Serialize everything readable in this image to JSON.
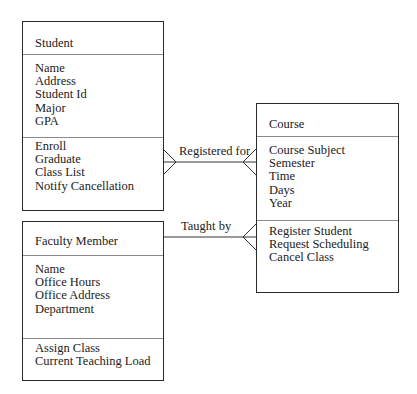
{
  "diagram": {
    "type": "uml-class-diagram",
    "classes": [
      {
        "id": "student",
        "name": "Student",
        "attributes": [
          "Name",
          "Address",
          "Student Id",
          "Major",
          "GPA"
        ],
        "operations": [
          "Enroll",
          "Graduate",
          "Class List",
          "Notify Cancellation"
        ]
      },
      {
        "id": "faculty",
        "name": "Faculty Member",
        "attributes": [
          "Name",
          "Office Hours",
          "Office Address",
          "Department"
        ],
        "operations": [
          "Assign Class",
          "Current Teaching Load"
        ]
      },
      {
        "id": "course",
        "name": "Course",
        "attributes": [
          "Course Subject",
          "Semester",
          "Time",
          "Days",
          "Year"
        ],
        "operations": [
          "Register Student",
          "Request Scheduling",
          "Cancel Class"
        ]
      }
    ],
    "associations": [
      {
        "label": "Registered for",
        "from": "Student",
        "to": "Course",
        "from_end": "many",
        "to_end": "many"
      },
      {
        "label": "Taught by",
        "from": "Faculty Member",
        "to": "Course",
        "from_end": "one",
        "to_end": "many"
      }
    ]
  }
}
